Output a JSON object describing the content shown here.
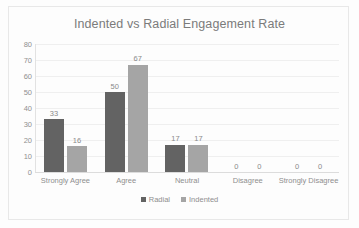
{
  "chart_data": {
    "type": "bar",
    "title": "Indented vs Radial Engagement Rate",
    "xlabel": "",
    "ylabel": "",
    "ylim": [
      0,
      80
    ],
    "ytick_step": 10,
    "yticks": [
      80,
      70,
      60,
      50,
      40,
      30,
      20,
      10,
      0
    ],
    "grid": true,
    "legend_position": "bottom-center",
    "categories": [
      "Strongly Agree",
      "Agree",
      "Neutral",
      "Disagree",
      "Strongly Disagree"
    ],
    "series": [
      {
        "name": "Radial",
        "color": "#636363",
        "values": [
          33,
          50,
          17,
          0,
          0
        ]
      },
      {
        "name": "Indented",
        "color": "#a5a5a5",
        "values": [
          16,
          67,
          17,
          0,
          0
        ]
      }
    ]
  }
}
